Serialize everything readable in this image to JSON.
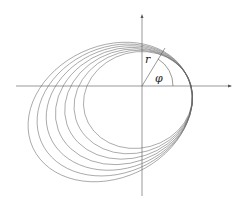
{
  "diagram": {
    "labels": {
      "radius": "r",
      "angle": "φ"
    },
    "curve_count": 7,
    "colors": {
      "curves": "#666666",
      "axes": "#555555",
      "text": "#222222"
    }
  }
}
